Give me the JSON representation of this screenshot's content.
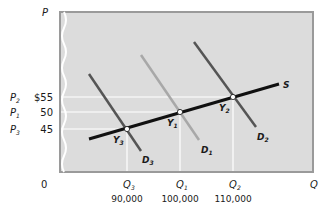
{
  "axes": {
    "y_label": "P",
    "x_label": "Q",
    "origin": "0"
  },
  "price_labels": [
    {
      "symbol": "P",
      "sub": "2",
      "value": "$55",
      "y": 97
    },
    {
      "symbol": "P",
      "sub": "1",
      "value": "50",
      "y": 112
    },
    {
      "symbol": "P",
      "sub": "3",
      "value": "45",
      "y": 129
    }
  ],
  "quantity_labels": [
    {
      "symbol": "Q",
      "sub": "3",
      "value": "90,000",
      "x": 127
    },
    {
      "symbol": "Q",
      "sub": "1",
      "value": "100,000",
      "x": 180
    },
    {
      "symbol": "Q",
      "sub": "2",
      "value": "110,000",
      "x": 233
    }
  ],
  "curves": {
    "supply": {
      "label": "S"
    },
    "demand": [
      {
        "label": "D",
        "sub": "3",
        "color": "#555555"
      },
      {
        "label": "D",
        "sub": "1",
        "color": "#a8a8a8"
      },
      {
        "label": "D",
        "sub": "2",
        "color": "#555555"
      }
    ]
  },
  "equilibria": [
    {
      "label": "Y",
      "sub": "3"
    },
    {
      "label": "Y",
      "sub": "1"
    },
    {
      "label": "Y",
      "sub": "2"
    }
  ],
  "colors": {
    "plot_bg": "#dcdcdc",
    "frame": "#9a9a9a",
    "supply": "#111111",
    "guides": "#ffffff"
  }
}
